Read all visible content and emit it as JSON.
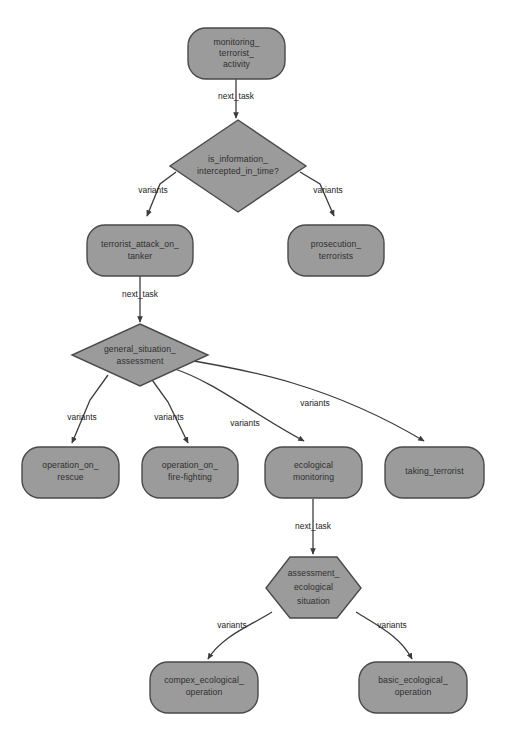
{
  "diagram": {
    "colors": {
      "node_fill": "#9b9b9b",
      "node_stroke": "#4a4a4a",
      "edge_stroke": "#3b3b3b",
      "label_text": "#2e2e2e",
      "background": "#ffffff"
    },
    "nodes": [
      {
        "id": "n1",
        "shape": "rounded-rect",
        "lines": [
          "monitoring_",
          "terrorist_",
          "activity"
        ]
      },
      {
        "id": "n2",
        "shape": "diamond",
        "lines": [
          "is_information_",
          "intercepted_in_time?"
        ]
      },
      {
        "id": "n3",
        "shape": "rounded-rect",
        "lines": [
          "terrorist_attack_on_",
          "tanker"
        ]
      },
      {
        "id": "n4",
        "shape": "rounded-rect",
        "lines": [
          "prosecution_",
          "terrorists"
        ]
      },
      {
        "id": "n5",
        "shape": "diamond",
        "lines": [
          "general_situation_",
          "assessment"
        ]
      },
      {
        "id": "n6",
        "shape": "rounded-rect",
        "lines": [
          "operation_on_",
          "rescue"
        ]
      },
      {
        "id": "n7",
        "shape": "rounded-rect",
        "lines": [
          "operation_on_",
          "fire-fighting"
        ]
      },
      {
        "id": "n8",
        "shape": "rounded-rect",
        "lines": [
          "ecological",
          "monitoring"
        ]
      },
      {
        "id": "n9",
        "shape": "rounded-rect",
        "lines": [
          "taking_terrorist"
        ]
      },
      {
        "id": "n10",
        "shape": "hexagon",
        "lines": [
          "assessment_",
          "ecological",
          "situation"
        ]
      },
      {
        "id": "n11",
        "shape": "rounded-rect",
        "lines": [
          "compex_ecological_",
          "operation"
        ]
      },
      {
        "id": "n12",
        "shape": "rounded-rect",
        "lines": [
          "basic_ecological_",
          "operation"
        ]
      }
    ],
    "edges": [
      {
        "from": "n1",
        "to": "n2",
        "label": "next_task"
      },
      {
        "from": "n2",
        "to": "n3",
        "label": "variants"
      },
      {
        "from": "n2",
        "to": "n4",
        "label": "variants"
      },
      {
        "from": "n3",
        "to": "n5",
        "label": "next_task"
      },
      {
        "from": "n5",
        "to": "n6",
        "label": "variants"
      },
      {
        "from": "n5",
        "to": "n7",
        "label": "variants"
      },
      {
        "from": "n5",
        "to": "n8",
        "label": "variants"
      },
      {
        "from": "n5",
        "to": "n9",
        "label": "variants"
      },
      {
        "from": "n8",
        "to": "n10",
        "label": "next_task"
      },
      {
        "from": "n10",
        "to": "n11",
        "label": "variants"
      },
      {
        "from": "n10",
        "to": "n12",
        "label": "variants"
      }
    ],
    "edge_labels": {
      "e1": "next_task",
      "e2": "variants",
      "e3": "variants",
      "e4": "next_task",
      "e5": "variants",
      "e6": "variants",
      "e7": "variants",
      "e8": "variants",
      "e9": "next_task",
      "e10": "variants",
      "e11": "variants"
    },
    "node_text": {
      "n1_l1": "monitoring_",
      "n1_l2": "terrorist_",
      "n1_l3": "activity",
      "n2_l1": "is_information_",
      "n2_l2": "intercepted_in_time?",
      "n3_l1": "terrorist_attack_on_",
      "n3_l2": "tanker",
      "n4_l1": "prosecution_",
      "n4_l2": "terrorists",
      "n5_l1": "general_situation_",
      "n5_l2": "assessment",
      "n6_l1": "operation_on_",
      "n6_l2": "rescue",
      "n7_l1": "operation_on_",
      "n7_l2": "fire-fighting",
      "n8_l1": "ecological",
      "n8_l2": "monitoring",
      "n9_l1": "taking_terrorist",
      "n10_l1": "assessment_",
      "n10_l2": "ecological",
      "n10_l3": "situation",
      "n11_l1": "compex_ecological_",
      "n11_l2": "operation",
      "n12_l1": "basic_ecological_",
      "n12_l2": "operation"
    }
  }
}
